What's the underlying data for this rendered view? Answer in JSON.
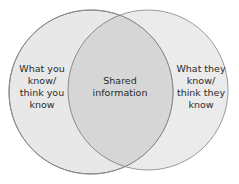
{
  "diagram": {
    "type": "venn",
    "colors": {
      "background": "#ffffff",
      "circle_fill": "#e8e8e8",
      "overlap_fill": "#d6d6d6",
      "circle_stroke": "#8a8a8a",
      "text": "#2a2a2a"
    },
    "left": {
      "lines": [
        "What you",
        "know/",
        "think you",
        "know"
      ]
    },
    "center": {
      "lines": [
        "Shared",
        "information"
      ]
    },
    "right": {
      "lines": [
        "What they",
        "know/",
        "think they",
        "know"
      ]
    }
  }
}
